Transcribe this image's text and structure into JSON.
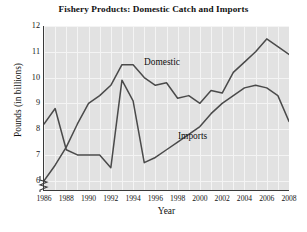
{
  "chart_data": {
    "type": "line",
    "title": "Fishery Products: Domestic Catch and Imports",
    "xlabel": "Year",
    "ylabel": "Pounds (in billions)",
    "xlim": [
      1986,
      2008
    ],
    "ylim": [
      5.6,
      12
    ],
    "ytick_values": [
      6,
      7,
      8,
      9,
      10,
      11,
      12
    ],
    "ytick_labels": [
      "6",
      "7",
      "8",
      "9",
      "10",
      "11",
      "12"
    ],
    "xtick_values": [
      1986,
      1988,
      1990,
      1992,
      1994,
      1996,
      1998,
      2000,
      2002,
      2004,
      2006,
      2008
    ],
    "xtick_labels": [
      "1986",
      "1988",
      "1990",
      "1992",
      "1994",
      "1996",
      "1998",
      "2000",
      "2002",
      "2004",
      "2006",
      "2008"
    ],
    "grid": true,
    "grid_color": "#f4f4f4",
    "plot_background": "#e2e2e2",
    "line_color": "#4a4a4a",
    "axis_break": true,
    "legend_position": "inline-annotations",
    "x": [
      1986,
      1987,
      1988,
      1989,
      1990,
      1991,
      1992,
      1993,
      1994,
      1995,
      1996,
      1997,
      1998,
      1999,
      2000,
      2001,
      2002,
      2003,
      2004,
      2005,
      2006,
      2007,
      2008
    ],
    "series": [
      {
        "name": "Domestic",
        "values": [
          8.2,
          8.8,
          7.2,
          7.0,
          7.0,
          7.0,
          6.5,
          9.9,
          9.1,
          6.7,
          6.9,
          7.2,
          7.5,
          7.8,
          8.1,
          8.6,
          9.0,
          9.3,
          9.6,
          9.7,
          9.6,
          9.3,
          8.3
        ]
      },
      {
        "name": "Imports",
        "values": [
          6.0,
          6.6,
          7.3,
          8.2,
          9.0,
          9.3,
          9.7,
          10.5,
          10.5,
          10.0,
          9.7,
          9.8,
          9.2,
          9.3,
          9.0,
          9.5,
          9.4,
          10.2,
          10.6,
          11.0,
          11.5,
          11.2,
          10.9
        ]
      }
    ],
    "annotations": [
      {
        "text": "Domestic",
        "x": 1994.2,
        "y": 10.55
      },
      {
        "text": "Imports",
        "x": 1999.5,
        "y": 7.9
      }
    ]
  }
}
